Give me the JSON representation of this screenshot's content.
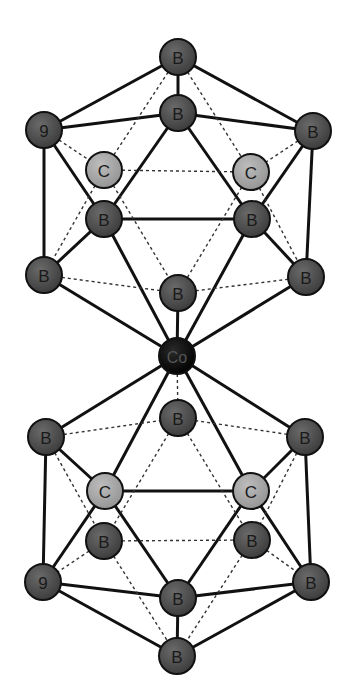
{
  "diagram": {
    "atom_radius": 18,
    "colors": {
      "boron": "#4a4a4a",
      "carbon": "#a6a6a6",
      "cobalt": "#0a0a0a",
      "outline": "#111111",
      "bond": "#111111"
    },
    "atoms": [
      {
        "id": "t0",
        "label": "B",
        "element": "boron",
        "x": 178,
        "y": 57
      },
      {
        "id": "t1",
        "label": "B",
        "element": "boron",
        "x": 178,
        "y": 113
      },
      {
        "id": "t2",
        "label": "9",
        "element": "boron",
        "x": 44,
        "y": 130
      },
      {
        "id": "t3",
        "label": "B",
        "element": "boron",
        "x": 313,
        "y": 131
      },
      {
        "id": "c1",
        "label": "C",
        "element": "carbon",
        "x": 104,
        "y": 170
      },
      {
        "id": "c2",
        "label": "C",
        "element": "carbon",
        "x": 251,
        "y": 172
      },
      {
        "id": "t4",
        "label": "B",
        "element": "boron",
        "x": 104,
        "y": 219
      },
      {
        "id": "t5",
        "label": "B",
        "element": "boron",
        "x": 252,
        "y": 219
      },
      {
        "id": "t6",
        "label": "B",
        "element": "boron",
        "x": 44,
        "y": 275
      },
      {
        "id": "t7",
        "label": "B",
        "element": "boron",
        "x": 306,
        "y": 277
      },
      {
        "id": "t8",
        "label": "B",
        "element": "boron",
        "x": 178,
        "y": 293
      },
      {
        "id": "co",
        "label": "Co",
        "element": "cobalt",
        "x": 177,
        "y": 356
      },
      {
        "id": "u8",
        "label": "B",
        "element": "boron",
        "x": 178,
        "y": 418
      },
      {
        "id": "u6",
        "label": "B",
        "element": "boron",
        "x": 46,
        "y": 437
      },
      {
        "id": "u7",
        "label": "B",
        "element": "boron",
        "x": 305,
        "y": 437
      },
      {
        "id": "d1",
        "label": "C",
        "element": "carbon",
        "x": 105,
        "y": 491
      },
      {
        "id": "d2",
        "label": "C",
        "element": "carbon",
        "x": 251,
        "y": 491
      },
      {
        "id": "u4",
        "label": "B",
        "element": "boron",
        "x": 104,
        "y": 541
      },
      {
        "id": "u5",
        "label": "B",
        "element": "boron",
        "x": 252,
        "y": 540
      },
      {
        "id": "u2",
        "label": "9",
        "element": "boron",
        "x": 43,
        "y": 582
      },
      {
        "id": "u3",
        "label": "B",
        "element": "boron",
        "x": 311,
        "y": 582
      },
      {
        "id": "u1",
        "label": "B",
        "element": "boron",
        "x": 178,
        "y": 598
      },
      {
        "id": "u0",
        "label": "B",
        "element": "boron",
        "x": 177,
        "y": 656
      }
    ],
    "bonds": [
      {
        "a": "t0",
        "b": "t2",
        "style": "solid"
      },
      {
        "a": "t0",
        "b": "t1",
        "style": "solid"
      },
      {
        "a": "t0",
        "b": "t3",
        "style": "solid"
      },
      {
        "a": "t1",
        "b": "t2",
        "style": "solid"
      },
      {
        "a": "t1",
        "b": "t3",
        "style": "solid"
      },
      {
        "a": "t1",
        "b": "t4",
        "style": "solid"
      },
      {
        "a": "t1",
        "b": "t5",
        "style": "solid"
      },
      {
        "a": "t2",
        "b": "t4",
        "style": "solid"
      },
      {
        "a": "t3",
        "b": "t5",
        "style": "solid"
      },
      {
        "a": "t4",
        "b": "t5",
        "style": "solid"
      },
      {
        "a": "t2",
        "b": "t6",
        "style": "solid"
      },
      {
        "a": "t3",
        "b": "t7",
        "style": "solid"
      },
      {
        "a": "t4",
        "b": "t6",
        "style": "solid"
      },
      {
        "a": "t5",
        "b": "t7",
        "style": "solid"
      },
      {
        "a": "t4",
        "b": "co",
        "style": "solid"
      },
      {
        "a": "t5",
        "b": "co",
        "style": "solid"
      },
      {
        "a": "t6",
        "b": "co",
        "style": "solid"
      },
      {
        "a": "t7",
        "b": "co",
        "style": "solid"
      },
      {
        "a": "t8",
        "b": "co",
        "style": "solid"
      },
      {
        "a": "t0",
        "b": "c1",
        "style": "dashed"
      },
      {
        "a": "t0",
        "b": "c2",
        "style": "dashed"
      },
      {
        "a": "t2",
        "b": "c1",
        "style": "dashed"
      },
      {
        "a": "t3",
        "b": "c2",
        "style": "dashed"
      },
      {
        "a": "c1",
        "b": "c2",
        "style": "dashed"
      },
      {
        "a": "c1",
        "b": "t6",
        "style": "dashed"
      },
      {
        "a": "c1",
        "b": "t8",
        "style": "dashed"
      },
      {
        "a": "c2",
        "b": "t8",
        "style": "dashed"
      },
      {
        "a": "c2",
        "b": "t7",
        "style": "dashed"
      },
      {
        "a": "t6",
        "b": "t8",
        "style": "dashed"
      },
      {
        "a": "t7",
        "b": "t8",
        "style": "dashed"
      },
      {
        "a": "co",
        "b": "u6",
        "style": "solid"
      },
      {
        "a": "co",
        "b": "u7",
        "style": "solid"
      },
      {
        "a": "co",
        "b": "u8",
        "style": "dashed"
      },
      {
        "a": "co",
        "b": "d1",
        "style": "solid"
      },
      {
        "a": "co",
        "b": "d2",
        "style": "solid"
      },
      {
        "a": "u6",
        "b": "d1",
        "style": "solid"
      },
      {
        "a": "u7",
        "b": "d2",
        "style": "solid"
      },
      {
        "a": "d1",
        "b": "d2",
        "style": "solid"
      },
      {
        "a": "u6",
        "b": "u2",
        "style": "solid"
      },
      {
        "a": "u7",
        "b": "u3",
        "style": "solid"
      },
      {
        "a": "d1",
        "b": "u2",
        "style": "solid"
      },
      {
        "a": "d1",
        "b": "u1",
        "style": "solid"
      },
      {
        "a": "d2",
        "b": "u1",
        "style": "solid"
      },
      {
        "a": "d2",
        "b": "u3",
        "style": "solid"
      },
      {
        "a": "u2",
        "b": "u1",
        "style": "solid"
      },
      {
        "a": "u3",
        "b": "u1",
        "style": "solid"
      },
      {
        "a": "u1",
        "b": "u0",
        "style": "solid"
      },
      {
        "a": "u2",
        "b": "u0",
        "style": "solid"
      },
      {
        "a": "u3",
        "b": "u0",
        "style": "solid"
      },
      {
        "a": "u6",
        "b": "u8",
        "style": "dashed"
      },
      {
        "a": "u7",
        "b": "u8",
        "style": "dashed"
      },
      {
        "a": "u8",
        "b": "u4",
        "style": "dashed"
      },
      {
        "a": "u8",
        "b": "u5",
        "style": "dashed"
      },
      {
        "a": "u6",
        "b": "u4",
        "style": "dashed"
      },
      {
        "a": "u7",
        "b": "u5",
        "style": "dashed"
      },
      {
        "a": "u4",
        "b": "u5",
        "style": "dashed"
      },
      {
        "a": "u4",
        "b": "u2",
        "style": "dashed"
      },
      {
        "a": "u5",
        "b": "u3",
        "style": "dashed"
      },
      {
        "a": "u4",
        "b": "u0",
        "style": "dashed"
      },
      {
        "a": "u5",
        "b": "u0",
        "style": "dashed"
      }
    ]
  }
}
